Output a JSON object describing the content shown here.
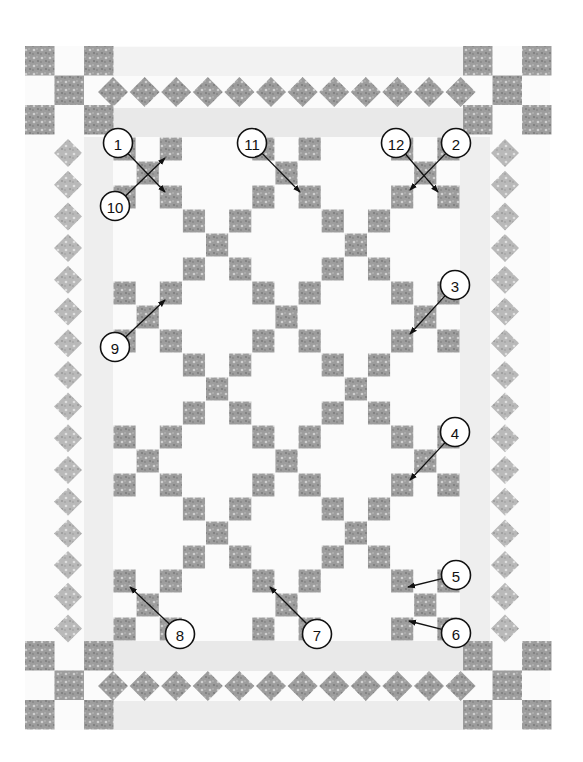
{
  "figure": {
    "colors": {
      "background": "#ffffff",
      "print_fabric": "#9a9a9a",
      "print_fabric_light": "#b8b8b8",
      "solid_border_strip": "#ececec",
      "callout_stroke": "#111111"
    }
  },
  "layout": {
    "quilt_bounds": {
      "x": 25,
      "y": 46,
      "width": 525,
      "height": 684
    },
    "center_field": {
      "x": 113,
      "y": 137,
      "width": 347,
      "height": 504,
      "cols": 5,
      "rows": 7
    },
    "center_block_structure": "X-pattern (5 print squares in 3x3 grid) alternating with plain blocks",
    "corner_blocks": "nine-patch checkerboard (5 print squares) at all four corners",
    "top_border": [
      "solid strip",
      "diamond sawtooth row",
      "solid strip"
    ],
    "bottom_border": [
      "solid strip",
      "diamond sawtooth row",
      "solid strip"
    ],
    "side_borders": [
      "diamond column",
      "solid strip"
    ]
  },
  "callouts": [
    {
      "label": "1",
      "cx": 118,
      "cy": 143,
      "to": [
        165,
        192
      ]
    },
    {
      "label": "2",
      "cx": 456,
      "cy": 143,
      "to": [
        410,
        190
      ]
    },
    {
      "label": "3",
      "cx": 455,
      "cy": 285,
      "to": [
        410,
        334
      ]
    },
    {
      "label": "4",
      "cx": 455,
      "cy": 432,
      "to": [
        410,
        480
      ]
    },
    {
      "label": "5",
      "cx": 456,
      "cy": 575,
      "to": [
        408,
        587
      ]
    },
    {
      "label": "6",
      "cx": 456,
      "cy": 633,
      "to": [
        409,
        621
      ]
    },
    {
      "label": "7",
      "cx": 317,
      "cy": 634,
      "to": [
        270,
        587
      ]
    },
    {
      "label": "8",
      "cx": 180,
      "cy": 634,
      "to": [
        130,
        587
      ]
    },
    {
      "label": "9",
      "cx": 115,
      "cy": 347,
      "to": [
        165,
        300
      ]
    },
    {
      "label": "10",
      "cx": 115,
      "cy": 206,
      "to": [
        165,
        158
      ]
    },
    {
      "label": "11",
      "cx": 252,
      "cy": 143,
      "to": [
        300,
        192
      ]
    },
    {
      "label": "12",
      "cx": 396,
      "cy": 143,
      "to": [
        438,
        192
      ]
    }
  ]
}
